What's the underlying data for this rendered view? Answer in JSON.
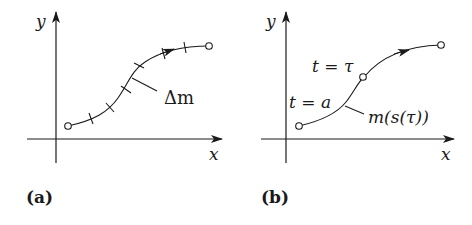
{
  "panels": [
    {
      "id": "a",
      "caption": "(a)",
      "axes": {
        "x_label": "x",
        "y_label": "y"
      },
      "curve_label": "Δm",
      "tick_count": 6,
      "endpoints": "open circles at start and end",
      "direction_arrow": true
    },
    {
      "id": "b",
      "caption": "(b)",
      "axes": {
        "x_label": "x",
        "y_label": "y"
      },
      "point_labels": [
        "t = a",
        "t = τ"
      ],
      "curve_label": "m(s(τ))",
      "marked_points": 3,
      "direction_arrow": true
    }
  ],
  "labels": {
    "a_y": "y",
    "a_x": "x",
    "a_delta": "Δm",
    "a_caption": "(a)",
    "b_y": "y",
    "b_x": "x",
    "b_t_tau": "t = τ",
    "b_t_a": "t = a",
    "b_m": "m(s(τ))",
    "b_caption": "(b)"
  },
  "colors": {
    "ink": "#1a1a1a",
    "background": "#ffffff"
  }
}
